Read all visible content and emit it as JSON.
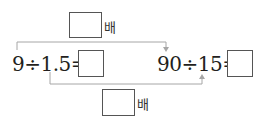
{
  "problem": {
    "top_multiplier": {
      "answer": "",
      "unit": "배"
    },
    "bottom_multiplier": {
      "answer": "",
      "unit": "배"
    },
    "left_equation": {
      "expression": "9÷1.5=",
      "answer": ""
    },
    "right_equation": {
      "expression": "90÷15=",
      "answer": ""
    }
  },
  "colors": {
    "line": "#a6a6a6",
    "box_border": "#555555",
    "text": "#231f20"
  }
}
